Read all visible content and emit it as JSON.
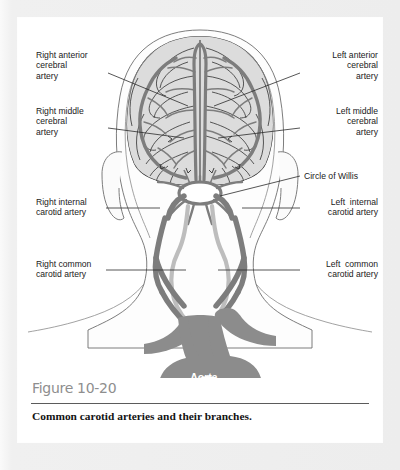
{
  "figure": {
    "number_label": "Figure 10-20",
    "caption": "Common carotid arteries and their branches."
  },
  "diagram": {
    "title_subject": "Common carotid arteries and their branches",
    "view": "anterior view of head, neck and aortic arch",
    "inline_labels": [
      {
        "id": "aorta",
        "text": "Aorta",
        "color": "#ffffff"
      }
    ],
    "labels": [
      {
        "id": "right-anterior-cerebral-artery",
        "side": "left",
        "text": "Right anterior\ncerebral\nartery"
      },
      {
        "id": "right-middle-cerebral-artery",
        "side": "left",
        "text": "Right middle\ncerebral\nartery"
      },
      {
        "id": "right-internal-carotid-artery",
        "side": "left",
        "text": "Right internal\ncarotid artery"
      },
      {
        "id": "right-common-carotid-artery",
        "side": "left",
        "text": "Right common\ncarotid artery"
      },
      {
        "id": "left-anterior-cerebral-artery",
        "side": "right",
        "text": "Left anterior\ncerebral\nartery"
      },
      {
        "id": "left-middle-cerebral-artery",
        "side": "right",
        "text": "Left middle\ncerebral\nartery"
      },
      {
        "id": "circle-of-willis",
        "side": "right",
        "text": "Circle of Willis"
      },
      {
        "id": "left-internal-carotid-artery",
        "side": "right",
        "text": "Left  internal\ncarotid artery"
      },
      {
        "id": "left-common-carotid-artery",
        "side": "right",
        "text": "Left  common\ncarotid artery"
      }
    ]
  },
  "colors": {
    "page_background": "#ffffff",
    "outer_frame": "#eeeeee",
    "artery_dark": "#7d7d7d",
    "artery_light": "#b9b9b9",
    "brain_fill": "#dcdcdc",
    "brain_outline": "#3b3b3b",
    "skin_outline": "#6e6e6e",
    "leader_line": "#2b2b2b",
    "label_text": "#1a1a1a",
    "figure_number_text": "#8e8e8e",
    "caption_text": "#131313"
  }
}
